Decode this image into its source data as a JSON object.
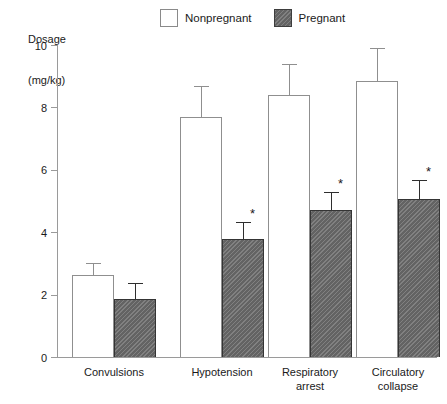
{
  "chart_data": {
    "type": "bar",
    "title": "",
    "subtitle": "",
    "unit_caption_lines": [
      "Dosage",
      "(mg/kg)"
    ],
    "xlabel": "",
    "ylabel": "Bupivacaine",
    "ylim": [
      0,
      10
    ],
    "yticks": [
      0,
      2,
      4,
      6,
      8,
      10
    ],
    "ytick_labels": [
      "0",
      "2",
      "4",
      "6",
      "8",
      "10"
    ],
    "grid": false,
    "legend_position": "top-center",
    "categories": [
      "Convulsions",
      "Hypotension",
      "Respiratory arrest",
      "Circulatory collapse"
    ],
    "category_label_lines": [
      [
        "Convulsions"
      ],
      [
        "Hypotension"
      ],
      [
        "Respiratory",
        "arrest"
      ],
      [
        "Circulatory",
        "collapse"
      ]
    ],
    "series": [
      {
        "name": "Nonpregnant",
        "color": "#ffffff",
        "edge_color": "#8f8f8f",
        "values": [
          2.63,
          7.68,
          8.4,
          8.85
        ],
        "errors": [
          0.38,
          1.0,
          1.0,
          1.05
        ],
        "significance": [
          "",
          "",
          "",
          ""
        ]
      },
      {
        "name": "Pregnant",
        "color": "#6e6e6e",
        "edge_color": "#343434",
        "values": [
          1.86,
          3.78,
          4.7,
          5.05
        ],
        "errors": [
          0.51,
          0.55,
          0.6,
          0.62
        ],
        "significance": [
          "",
          "*",
          "*",
          "*"
        ]
      }
    ],
    "annotations": [
      {
        "text": "*",
        "category": "Hypotension",
        "series": "Pregnant",
        "meaning": "significant vs nonpregnant"
      },
      {
        "text": "*",
        "category": "Respiratory arrest",
        "series": "Pregnant",
        "meaning": "significant vs nonpregnant"
      },
      {
        "text": "*",
        "category": "Circulatory collapse",
        "series": "Pregnant",
        "meaning": "significant vs nonpregnant"
      }
    ]
  },
  "legend": {
    "items": [
      {
        "label": "Nonpregnant",
        "swatch": "nonpregnant"
      },
      {
        "label": "Pregnant",
        "swatch": "pregnant"
      }
    ]
  }
}
